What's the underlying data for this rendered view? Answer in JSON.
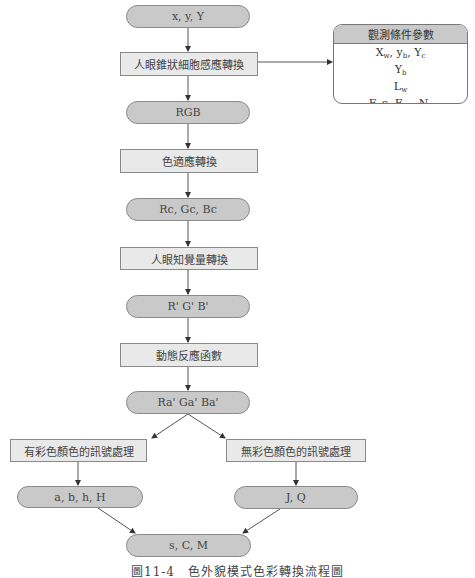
{
  "flow": {
    "start": "x, y, Y",
    "step1": "人眼錐狀細胞感應轉換",
    "rgb": "RGB",
    "step2": "色適應轉換",
    "rcgcbc": "Rc, Gc, Bc",
    "step3": "人眼知覺量轉換",
    "rgb_prime": "R'  G'  B'",
    "step4": "動態反應函數",
    "ra_prime": "Ra'  Ga'  Ba'",
    "chromatic": "有彩色顏色的訊號處理",
    "achromatic": "無彩色顏色的訊號處理",
    "chromatic_out": "a, b, h, H",
    "achromatic_out": "J, Q",
    "final": "s, C, M"
  },
  "params": {
    "title": "觀測條件參數",
    "line1": {
      "X": "X",
      "X_sub": "w",
      "y": "y",
      "y_sub": "b",
      "Y": "Y",
      "Y_sub": "c"
    },
    "line2": {
      "Y": "Y",
      "Y_sub": "b"
    },
    "line3": {
      "L": "L",
      "L_sub": "w"
    },
    "line4": {
      "prefix": "F, c, F",
      "F_sub": "LL",
      "N": "N",
      "N_sub": "c"
    }
  },
  "caption": "圖11-4　色外貌模式色彩轉換流程圖",
  "colors": {
    "pill_fill": "#c9c9c9",
    "rect_fill": "#e9e9e9",
    "stroke": "#8a8a8a"
  }
}
